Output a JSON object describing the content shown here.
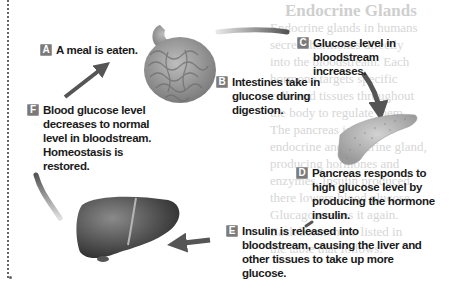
{
  "background_text": {
    "title": "Endocrine Glands",
    "lines": [
      "Endocrine glands in humans",
      "secrete hormones directly",
      "into the bloodstream. Each",
      "hormone targets specific",
      "cells and tissues throughout",
      "the body to regulate them.",
      "The pancreas is both an",
      "endocrine and exocrine gland,",
      "producing hormones and",
      "enzymes. Insulin produced",
      "there lowers blood glucose.",
      "Glucagon raises it again.",
      "Each hormone is listed in",
      "the table that follows."
    ]
  },
  "steps": {
    "A": {
      "badge": "A",
      "text": "A meal is eaten."
    },
    "B": {
      "badge": "B",
      "text": "Intestines take in glucose during digestion."
    },
    "C": {
      "badge": "C",
      "text": "Glucose level in bloodstream increases."
    },
    "D": {
      "badge": "D",
      "text": "Pancreas responds to high glucose level by producing the hormone insulin."
    },
    "E": {
      "badge": "E",
      "text": "Insulin is released into bloodstream, causing the liver and other tissues to take up more glucose."
    },
    "F": {
      "badge": "F",
      "text": "Blood glucose level decreases to normal level in bloodstream. Homeostasis is restored."
    }
  },
  "organs": [
    "intestines",
    "pancreas",
    "liver"
  ],
  "colors": {
    "badge": "#7a7a7a",
    "arrow": "#5a5a5a",
    "text": "#1a1a1a",
    "ghost_text": "#d6d6d6"
  }
}
